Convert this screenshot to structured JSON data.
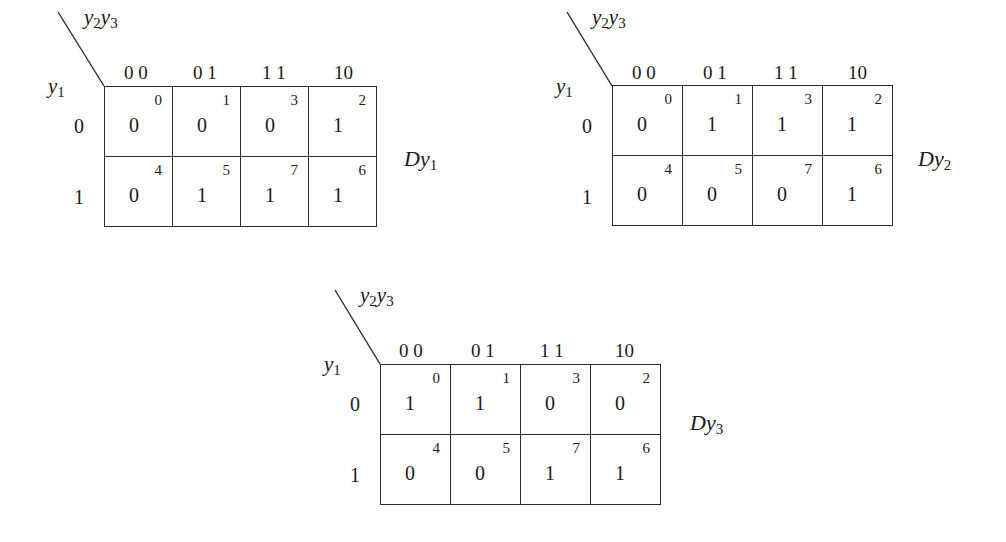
{
  "maps": [
    {
      "function_label": "Dy",
      "function_sub": "1",
      "col_var": {
        "a": "y",
        "a_sub": "2",
        "b": "y",
        "b_sub": "3"
      },
      "row_var": {
        "a": "y",
        "a_sub": "1"
      },
      "col_headers": [
        "0 0",
        "0 1",
        "1 1",
        "10"
      ],
      "row_headers": [
        "0",
        "1"
      ],
      "cells": [
        [
          {
            "value": "0",
            "index": "0"
          },
          {
            "value": "0",
            "index": "1"
          },
          {
            "value": "0",
            "index": "3"
          },
          {
            "value": "1",
            "index": "2"
          }
        ],
        [
          {
            "value": "0",
            "index": "4"
          },
          {
            "value": "1",
            "index": "5"
          },
          {
            "value": "1",
            "index": "7"
          },
          {
            "value": "1",
            "index": "6"
          }
        ]
      ]
    },
    {
      "function_label": "Dy",
      "function_sub": "2",
      "col_var": {
        "a": "y",
        "a_sub": "2",
        "b": "y",
        "b_sub": "3"
      },
      "row_var": {
        "a": "y",
        "a_sub": "1"
      },
      "col_headers": [
        "0 0",
        "0 1",
        "1 1",
        "10"
      ],
      "row_headers": [
        "0",
        "1"
      ],
      "cells": [
        [
          {
            "value": "0",
            "index": "0"
          },
          {
            "value": "1",
            "index": "1"
          },
          {
            "value": "1",
            "index": "3"
          },
          {
            "value": "1",
            "index": "2"
          }
        ],
        [
          {
            "value": "0",
            "index": "4"
          },
          {
            "value": "0",
            "index": "5"
          },
          {
            "value": "0",
            "index": "7"
          },
          {
            "value": "1",
            "index": "6"
          }
        ]
      ]
    },
    {
      "function_label": "Dy",
      "function_sub": "3",
      "col_var": {
        "a": "y",
        "a_sub": "2",
        "b": "y",
        "b_sub": "3"
      },
      "row_var": {
        "a": "y",
        "a_sub": "1"
      },
      "col_headers": [
        "0 0",
        "0 1",
        "1 1",
        "10"
      ],
      "row_headers": [
        "0",
        "1"
      ],
      "cells": [
        [
          {
            "value": "1",
            "index": "0"
          },
          {
            "value": "1",
            "index": "1"
          },
          {
            "value": "0",
            "index": "3"
          },
          {
            "value": "0",
            "index": "2"
          }
        ],
        [
          {
            "value": "0",
            "index": "4"
          },
          {
            "value": "0",
            "index": "5"
          },
          {
            "value": "1",
            "index": "7"
          },
          {
            "value": "1",
            "index": "6"
          }
        ]
      ]
    }
  ]
}
